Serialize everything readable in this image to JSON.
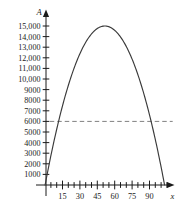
{
  "chart_data": {
    "type": "line",
    "title": "",
    "xlabel": "x",
    "ylabel": "A",
    "xlim": [
      0,
      110
    ],
    "ylim": [
      0,
      15800
    ],
    "grid": false,
    "legend": null,
    "y_ticks": [
      1000,
      2000,
      3000,
      4000,
      5000,
      6000,
      7000,
      8000,
      9000,
      10000,
      11000,
      12000,
      13000,
      14000,
      15000
    ],
    "y_tick_labels": [
      "1000",
      "2000",
      "3000",
      "4000",
      "5000",
      "6000",
      "7000",
      "8000",
      "9000",
      "10,000",
      "11,000",
      "12,000",
      "13,000",
      "14,000",
      "15,000"
    ],
    "x_ticks": [
      15,
      30,
      45,
      60,
      75,
      90
    ],
    "x_tick_labels": [
      "15",
      "30",
      "45",
      "60",
      "75",
      "90"
    ],
    "x_minor_tick_step": 5,
    "x_minor_tick_max": 105,
    "series": [
      {
        "name": "A(x)",
        "kind": "parabola",
        "roots": [
          0,
          103
        ],
        "vertex_x": 51.5,
        "vertex_y": 15000,
        "x": [
          0,
          5,
          10,
          15,
          20,
          25,
          30,
          35,
          40,
          45,
          50,
          55,
          60,
          65,
          70,
          75,
          80,
          85,
          90,
          95,
          100,
          103
        ],
        "values": [
          0,
          2771,
          5259,
          7463,
          9384,
          11022,
          12376,
          13447,
          14234,
          14738,
          14959,
          14896,
          14550,
          13920,
          13007,
          11811,
          10331,
          8567,
          6520,
          4190,
          1576,
          0
        ]
      }
    ],
    "reference_lines": [
      {
        "name": "A = 6000",
        "orientation": "horizontal",
        "value": 6000,
        "style": "dashed",
        "color": "#808080",
        "x_start": 4,
        "x_end": 110
      }
    ],
    "colors": {
      "curve": "#3a3a3a",
      "axis": "#1b1b1b",
      "dashed_line": "#808080",
      "background": "#ffffff"
    }
  },
  "axis_labels": {
    "y_axis_name": "A",
    "x_axis_name": "x"
  }
}
